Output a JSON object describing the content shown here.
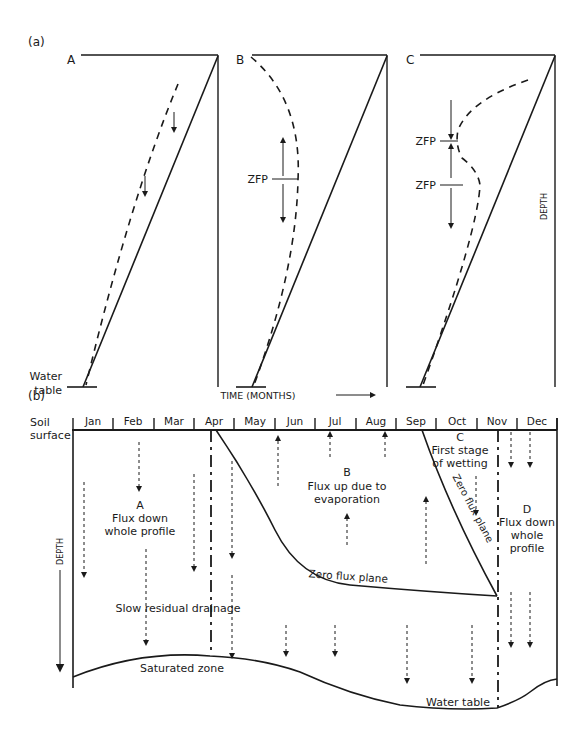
{
  "panel_a": {
    "label": "(a)",
    "profiles": [
      {
        "id": "A",
        "label": "A"
      },
      {
        "id": "B",
        "label": "B",
        "zfp": "ZFP"
      },
      {
        "id": "C",
        "label": "C",
        "zfp_upper": "ZFP",
        "zfp_lower": "ZFP"
      }
    ],
    "water_table_label_line1": "Water",
    "water_table_label_line2": "table",
    "depth_label": "DEPTH"
  },
  "panel_b": {
    "label": "(b)",
    "time_label": "TIME (MONTHS)",
    "soil_surface_line1": "Soil",
    "soil_surface_line2": "surface",
    "depth_label": "DEPTH",
    "months": [
      "Jan",
      "Feb",
      "Mar",
      "Apr",
      "May",
      "Jun",
      "Jul",
      "Aug",
      "Sep",
      "Oct",
      "Nov",
      "Dec"
    ],
    "zones": {
      "A": {
        "letter": "A",
        "line1": "Flux down",
        "line2": "whole profile"
      },
      "B": {
        "letter": "B",
        "line1": "Flux up due to",
        "line2": "evaporation"
      },
      "C": {
        "letter": "C",
        "line1": "First stage",
        "line2": "of wetting"
      },
      "D": {
        "letter": "D",
        "line1": "Flux down",
        "line2": "whole",
        "line3": "profile"
      }
    },
    "zero_flux_plane_horizontal": "Zero flux plane",
    "zero_flux_plane_diagonal": "Zero flux plane",
    "slow_drainage": "Slow residual drainage",
    "saturated_zone": "Saturated zone",
    "water_table": "Water table"
  }
}
